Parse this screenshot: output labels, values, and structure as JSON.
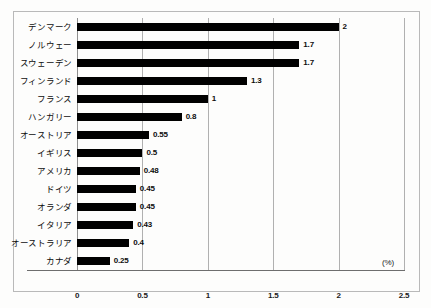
{
  "chart_data": {
    "type": "bar",
    "orientation": "horizontal",
    "title": "",
    "xlabel": "(%)",
    "ylabel": "",
    "xlim": [
      0,
      2.5
    ],
    "xticks": [
      "0",
      "0.5",
      "1",
      "1.5",
      "2",
      "2.5"
    ],
    "xtick_values": [
      0,
      0.5,
      1,
      1.5,
      2,
      2.5
    ],
    "grid": true,
    "legend": false,
    "bar_color": "#000000",
    "grid_color": "#b0b0b0",
    "categories": [
      "デンマーク",
      "ノルウェー",
      "スウェーデン",
      "フィンランド",
      "フランス",
      "ハンガリー",
      "オーストリア",
      "イギリス",
      "アメリカ",
      "ドイツ",
      "オランダ",
      "イタリア",
      "オーストラリア",
      "カナダ"
    ],
    "values": [
      2,
      1.7,
      1.7,
      1.3,
      1,
      0.8,
      0.55,
      0.5,
      0.48,
      0.45,
      0.45,
      0.43,
      0.4,
      0.25
    ],
    "value_labels": [
      "2",
      "1.7",
      "1.7",
      "1.3",
      "1",
      "0.8",
      "0.55",
      "0.5",
      "0.48",
      "0.45",
      "0.45",
      "0.43",
      "0.4",
      "0.25"
    ]
  }
}
